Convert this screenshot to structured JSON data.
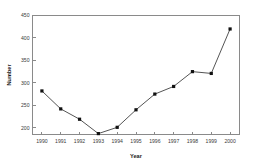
{
  "chart_data": {
    "type": "line",
    "title": "",
    "subtitle": "",
    "xlabel": "Year",
    "ylabel": "Number",
    "categories": [
      1990,
      1991,
      1992,
      1993,
      1994,
      1995,
      1996,
      1997,
      1998,
      1999,
      2000
    ],
    "x": [
      1990,
      1991,
      1992,
      1993,
      1994,
      1995,
      1996,
      1997,
      1998,
      1999,
      2000
    ],
    "values": [
      282,
      242,
      219,
      187,
      201,
      240,
      275,
      292,
      325,
      321,
      420
    ],
    "series": [
      {
        "name": "Number",
        "values": [
          282,
          242,
          219,
          187,
          201,
          240,
          275,
          292,
          325,
          321,
          420
        ]
      }
    ],
    "xtick_labels": [
      "1990",
      "1991",
      "1992",
      "1993",
      "1994",
      "1995",
      "1996",
      "1997",
      "1998",
      "1999",
      "2000"
    ],
    "ytick_labels": [
      "200",
      "250",
      "300",
      "350",
      "400",
      "450"
    ],
    "yticks": [
      200,
      250,
      300,
      350,
      400,
      450
    ],
    "xlim": [
      1989.5,
      2000.5
    ],
    "ylim": [
      185,
      450
    ],
    "grid": false,
    "legend": false,
    "legend_position": "none",
    "marker": "square",
    "annotations": [],
    "colors": {
      "line": "#555555",
      "marker": "#111111",
      "axis": "#8a8a8a",
      "text": "#1a1a1a",
      "background": "#ffffff"
    }
  }
}
